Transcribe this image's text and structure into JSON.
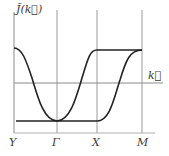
{
  "diagram": {
    "y_axis_label": "J̃(k⃗)",
    "x_axis_label": "k⃗",
    "x_tick_labels": [
      "Y",
      "Γ",
      "X",
      "M"
    ],
    "colors": {
      "axes": "#8a8a8a",
      "curve": "#222222",
      "text": "#3a3a3a"
    },
    "curves": [
      {
        "name": "curve-1",
        "description": "Starts at top level at Y, descends to minimum at Γ, rises to top level at X, flat until M"
      },
      {
        "name": "curve-2",
        "description": "Flat at bottom level from Y through Γ to X, rises to top level at M"
      }
    ]
  }
}
